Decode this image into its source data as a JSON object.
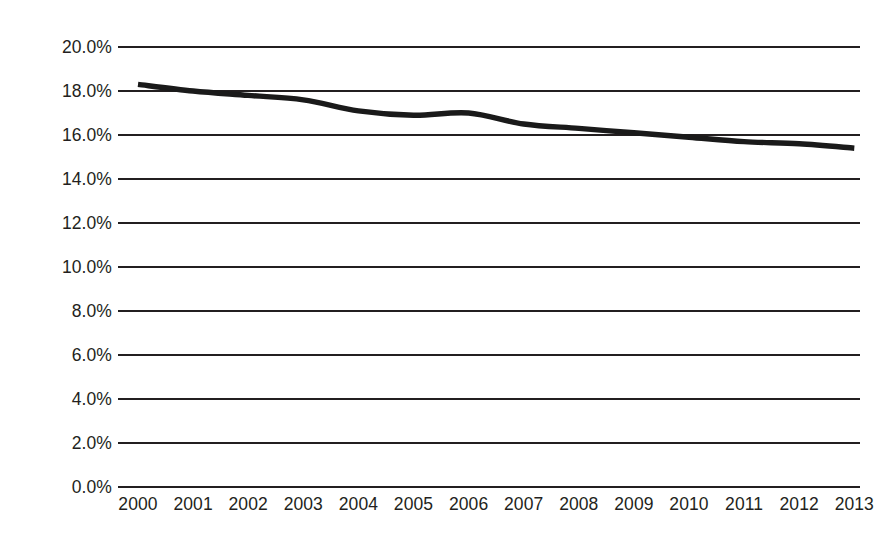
{
  "chart_data": {
    "type": "line",
    "title": "",
    "subtitle": "",
    "xlabel": "",
    "ylabel": "",
    "categories": [
      "2000",
      "2001",
      "2002",
      "2003",
      "2004",
      "2005",
      "2006",
      "2007",
      "2008",
      "2009",
      "2010",
      "2011",
      "2012",
      "2013"
    ],
    "series": [
      {
        "name": "",
        "values": [
          18.3,
          18.0,
          17.8,
          17.6,
          17.1,
          16.9,
          17.0,
          16.5,
          16.3,
          16.1,
          15.9,
          15.7,
          15.6,
          15.4
        ],
        "color": "#1a1a1a",
        "line_width_px": 5.4
      }
    ],
    "ylim": [
      0.0,
      20.0
    ],
    "y_tick_values": [
      0.0,
      2.0,
      4.0,
      6.0,
      8.0,
      10.0,
      12.0,
      14.0,
      16.0,
      18.0,
      20.0
    ],
    "y_tick_labels": [
      "0.0%",
      "2.0%",
      "4.0%",
      "6.0%",
      "8.0%",
      "10.0%",
      "12.0%",
      "14.0%",
      "16.0%",
      "18.0%",
      "20.0%"
    ],
    "x_tick_labels": [
      "2000",
      "2001",
      "2002",
      "2003",
      "2004",
      "2005",
      "2006",
      "2007",
      "2008",
      "2009",
      "2010",
      "2011",
      "2012",
      "2013"
    ],
    "grid": {
      "horizontal": true,
      "vertical": false,
      "color": "#231f20"
    },
    "legend": {
      "visible": false,
      "position": "none",
      "entries": []
    },
    "annotations": [],
    "background_color": "#ffffff",
    "text_color": "#231f20"
  }
}
